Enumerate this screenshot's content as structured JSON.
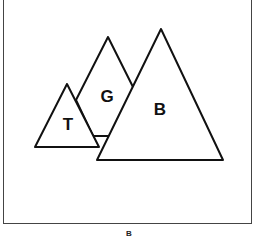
{
  "diagram": {
    "caption": "B",
    "shapes": [
      {
        "id": "G",
        "label": "G",
        "type": "triangle"
      },
      {
        "id": "T",
        "label": "T",
        "type": "triangle"
      },
      {
        "id": "B",
        "label": "B",
        "type": "triangle"
      }
    ]
  }
}
